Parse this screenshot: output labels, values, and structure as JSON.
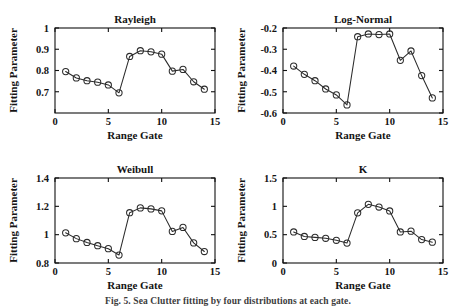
{
  "figure": {
    "caption": "Fig. 5.  Sea Clutter fitting by four distributions at each gate."
  },
  "chart_data": [
    {
      "type": "line",
      "title": "Rayleigh",
      "xlabel": "Range Gate",
      "ylabel": "Fitting Parameter",
      "xlim": [
        0,
        15
      ],
      "ylim": [
        0.6,
        1
      ],
      "xticks": [
        0,
        5,
        10,
        15
      ],
      "xtick_labels": [
        "0",
        "5",
        "10",
        "15"
      ],
      "yticks": [
        0.7,
        0.8,
        0.9,
        1
      ],
      "ytick_labels": [
        "0.7",
        "0.8",
        "0.9",
        "1"
      ],
      "grid": false,
      "legend": "none",
      "marker": "circle",
      "x": [
        1,
        2,
        3,
        4,
        5,
        6,
        7,
        8,
        9,
        10,
        11,
        12,
        13,
        14
      ],
      "values": [
        0.795,
        0.765,
        0.752,
        0.745,
        0.732,
        0.695,
        0.866,
        0.893,
        0.888,
        0.877,
        0.797,
        0.805,
        0.747,
        0.712
      ]
    },
    {
      "type": "line",
      "title": "Log-Normal",
      "xlabel": "Range Gate",
      "ylabel": "Fitting Parameter",
      "xlim": [
        0,
        15
      ],
      "ylim": [
        -0.6,
        -0.2
      ],
      "xticks": [
        0,
        5,
        10,
        15
      ],
      "xtick_labels": [
        "0",
        "5",
        "10",
        "15"
      ],
      "yticks": [
        -0.6,
        -0.5,
        -0.4,
        -0.3,
        -0.2
      ],
      "ytick_labels": [
        "-0.6",
        "-0.5",
        "-0.4",
        "-0.3",
        "-0.2"
      ],
      "grid": false,
      "legend": "none",
      "marker": "circle",
      "x": [
        1,
        2,
        3,
        4,
        5,
        6,
        7,
        8,
        9,
        10,
        11,
        12,
        13,
        14
      ],
      "values": [
        -0.379,
        -0.418,
        -0.448,
        -0.487,
        -0.515,
        -0.562,
        -0.241,
        -0.228,
        -0.231,
        -0.228,
        -0.352,
        -0.308,
        -0.424,
        -0.529
      ]
    },
    {
      "type": "line",
      "title": "Weibull",
      "xlabel": "Range Gate",
      "ylabel": "Fitting Parameter",
      "xlim": [
        0,
        15
      ],
      "ylim": [
        0.8,
        1.4
      ],
      "xticks": [
        0,
        5,
        10,
        15
      ],
      "xtick_labels": [
        "0",
        "5",
        "10",
        "15"
      ],
      "yticks": [
        0.8,
        1,
        1.2,
        1.4
      ],
      "ytick_labels": [
        "0.8",
        "1",
        "1.2",
        "1.4"
      ],
      "grid": false,
      "legend": "none",
      "marker": "circle",
      "x": [
        1,
        2,
        3,
        4,
        5,
        6,
        7,
        8,
        9,
        10,
        11,
        12,
        13,
        14
      ],
      "values": [
        1.013,
        0.972,
        0.945,
        0.922,
        0.901,
        0.856,
        1.155,
        1.189,
        1.182,
        1.168,
        1.023,
        1.051,
        0.942,
        0.881
      ]
    },
    {
      "type": "line",
      "title": "K",
      "xlabel": "Range Gate",
      "ylabel": "Fitting Parameter",
      "xlim": [
        0,
        15
      ],
      "ylim": [
        0,
        1.5
      ],
      "xticks": [
        0,
        5,
        10,
        15
      ],
      "xtick_labels": [
        "0",
        "5",
        "10",
        "15"
      ],
      "yticks": [
        0,
        0.5,
        1,
        1.5
      ],
      "ytick_labels": [
        "0",
        "0.5",
        "1",
        "1.5"
      ],
      "grid": false,
      "legend": "none",
      "marker": "circle",
      "x": [
        1,
        2,
        3,
        4,
        5,
        6,
        7,
        8,
        9,
        10,
        11,
        12,
        13,
        14
      ],
      "values": [
        0.548,
        0.468,
        0.452,
        0.436,
        0.401,
        0.352,
        0.885,
        1.035,
        0.988,
        0.918,
        0.548,
        0.562,
        0.413,
        0.368
      ]
    }
  ]
}
